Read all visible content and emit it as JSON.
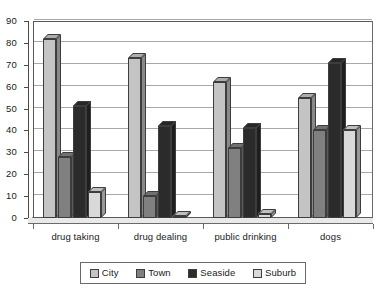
{
  "chart_data": {
    "type": "bar",
    "title": "",
    "subtitle": "",
    "xlabel": "",
    "ylabel": "",
    "categories": [
      "drug taking",
      "drug dealing",
      "public drinking",
      "dogs"
    ],
    "series": [
      {
        "name": "City",
        "color": "#c4c4c4",
        "values": [
          82,
          73,
          62,
          55
        ]
      },
      {
        "name": "Town",
        "color": "#808080",
        "values": [
          28,
          10,
          32,
          40
        ]
      },
      {
        "name": "Seaside",
        "color": "#2b2b2b",
        "values": [
          51,
          42,
          41,
          71
        ]
      },
      {
        "name": "Suburb",
        "color": "#d9d9d9",
        "values": [
          12,
          1,
          2,
          40
        ]
      }
    ],
    "ylim": [
      0,
      90
    ],
    "yticks": [
      0,
      10,
      20,
      30,
      40,
      50,
      60,
      70,
      80,
      90
    ],
    "ytick_labels": [
      "0",
      "10",
      "20",
      "30",
      "40",
      "50",
      "60",
      "70",
      "80",
      "90"
    ],
    "grid": true,
    "legend_position": "bottom",
    "legend_entries": [
      "City",
      "Town",
      "Seaside",
      "Suburb"
    ],
    "style": "3d-column",
    "plot_background": "#ffffff",
    "grid_color": "#a8a8a8",
    "axis_color": "#4a4a4a"
  }
}
